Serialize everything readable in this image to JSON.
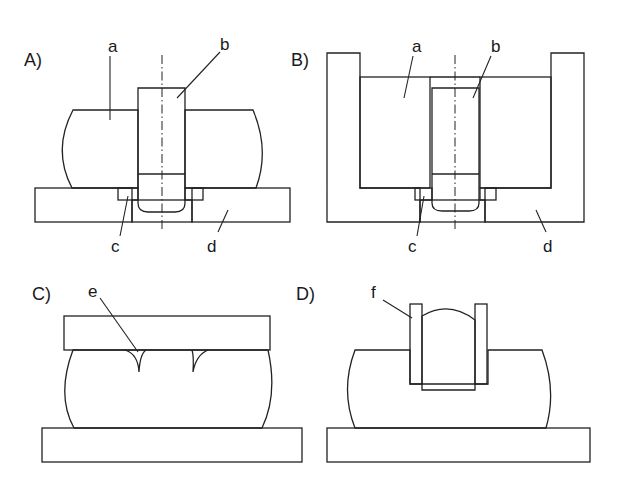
{
  "figure": {
    "panels": [
      {
        "id": "A",
        "label": "A)",
        "parts": [
          "a",
          "b",
          "c",
          "d"
        ]
      },
      {
        "id": "B",
        "label": "B)",
        "parts": [
          "a",
          "b",
          "c",
          "d"
        ]
      },
      {
        "id": "C",
        "label": "C)",
        "parts": [
          "e"
        ]
      },
      {
        "id": "D",
        "label": "D)",
        "parts": [
          "f"
        ]
      }
    ],
    "part_labels": {
      "a": "a",
      "b": "b",
      "c": "c",
      "d": "d",
      "e": "e",
      "f": "f"
    },
    "colors": {
      "line": "#222222",
      "background": "#ffffff"
    }
  }
}
